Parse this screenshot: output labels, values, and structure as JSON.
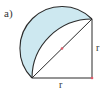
{
  "figure": {
    "label": "a)",
    "side_labels": {
      "bottom": "r",
      "right": "r"
    }
  },
  "colors": {
    "stroke": "#2b2b2b",
    "fill": "#cde8f0",
    "marker": "#e05a6a",
    "text": "#333333"
  },
  "geometry": {
    "square_corner_bottom_left": [
      32,
      78
    ],
    "square_corner_bottom_right": [
      92,
      78
    ],
    "square_corner_top_right": [
      92,
      19
    ],
    "diagonal_midpoint": [
      62,
      48.5
    ],
    "semicircle_radius": 42,
    "quarter_circle_radius": 60
  }
}
